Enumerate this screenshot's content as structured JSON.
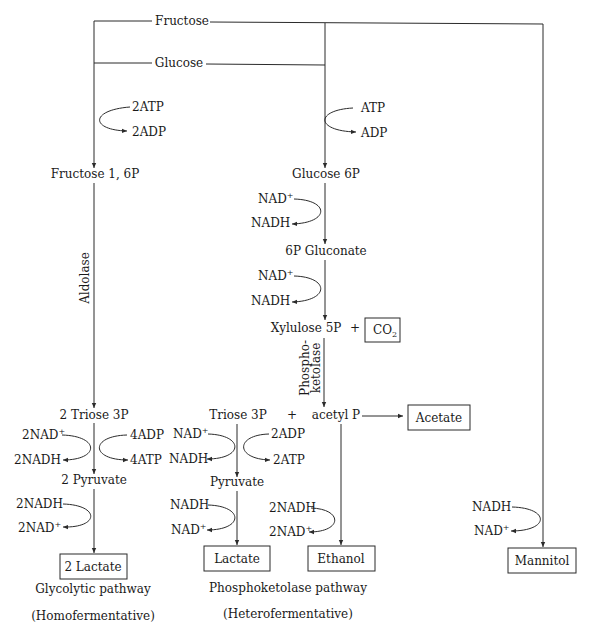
{
  "substrates": {
    "fructose": "Fructose",
    "glucose": "Glucose"
  },
  "glycolytic": {
    "cofactor_in_1": "2ATP",
    "cofactor_out_1": "2ADP",
    "intermediate_1": "Fructose 1, 6P",
    "enzyme": "Aldolase",
    "intermediate_2": "2 Triose 3P",
    "nad_in": "2NAD",
    "nad_out": "2NADH",
    "adp_in": "4ADP",
    "atp_out": "4ATP",
    "intermediate_3": "2 Pyruvate",
    "nadh_in": "2NADH",
    "nad_out_2": "2NAD",
    "product": "2 Lactate",
    "caption": "Glycolytic pathway",
    "subcaption": "(Homofermentative)"
  },
  "phosphoketolase": {
    "cofactor_in_1": "ATP",
    "cofactor_out_1": "ADP",
    "intermediate_1": "Glucose 6P",
    "nad_in_1": "NAD",
    "nadh_out_1": "NADH",
    "intermediate_2": "6P Gluconate",
    "nad_in_2": "NAD",
    "nadh_out_2": "NADH",
    "intermediate_3": "Xylulose 5P",
    "plus": "+",
    "co2": "CO",
    "co2_sub": "2",
    "enzyme_line1": "Phospho-",
    "enzyme_line2": "ketolase",
    "triose": "Triose 3P",
    "plus_2": "+",
    "acetyl": "acetyl P",
    "acetate": "Acetate",
    "nad_in_3": "NAD",
    "nadh_out_3": "NADH",
    "adp_in": "2ADP",
    "atp_out": "2ATP",
    "pyruvate": "Pyruvate",
    "nadh_in_4": "NADH",
    "nad_out_4": "NAD",
    "lactate": "Lactate",
    "nadh_in_5": "2NADH",
    "nad_out_5": "2NAD",
    "ethanol": "Ethanol",
    "caption": "Phosphoketolase pathway",
    "subcaption": "(Heterofermentative)"
  },
  "mannitol_branch": {
    "nadh_in": "NADH",
    "nad_out": "NAD",
    "product": "Mannitol"
  },
  "superscript_plus": "+"
}
